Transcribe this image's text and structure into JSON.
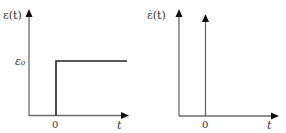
{
  "colors": {
    "axis": "#6a6a6a",
    "signal": "#222222",
    "text": "#333333",
    "background": "#ffffff"
  },
  "left_plot": {
    "y_label": "ε(t)",
    "level_label": "ε₀",
    "origin_label": "0",
    "x_label": "t",
    "signal_type": "step"
  },
  "right_plot": {
    "y_label": "ε̇(t)",
    "origin_label": "0",
    "x_label": "t",
    "signal_type": "impulse"
  }
}
